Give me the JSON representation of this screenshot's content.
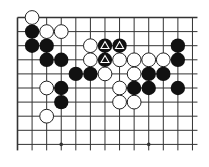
{
  "diagram": {
    "type": "go-board-fragment",
    "columns": 13,
    "rows": 10,
    "edges": {
      "top": true,
      "left": true,
      "right": false,
      "bottom": false
    },
    "star_points": [
      [
        3,
        9
      ],
      [
        9,
        9
      ]
    ],
    "colors": {
      "line": "#333333",
      "black": "#111111",
      "white": "#ffffff",
      "stone_outline": "#222222",
      "background": "#ffffff"
    },
    "stones": {
      "white": [
        [
          1,
          0
        ],
        [
          2,
          1
        ],
        [
          3,
          1
        ],
        [
          5,
          2
        ],
        [
          5,
          3
        ],
        [
          7,
          3
        ],
        [
          8,
          3
        ],
        [
          9,
          3
        ],
        [
          10,
          3
        ],
        [
          6,
          4
        ],
        [
          8,
          4
        ],
        [
          2,
          5
        ],
        [
          7,
          5
        ],
        [
          7,
          6
        ],
        [
          8,
          6
        ],
        [
          2,
          7
        ]
      ],
      "black": [
        [
          1,
          1
        ],
        [
          1,
          2
        ],
        [
          2,
          2
        ],
        [
          2,
          3
        ],
        [
          3,
          3
        ],
        [
          4,
          4
        ],
        [
          5,
          4
        ],
        [
          3,
          5
        ],
        [
          3,
          6
        ],
        [
          11,
          2
        ],
        [
          11,
          3
        ],
        [
          9,
          4
        ],
        [
          10,
          4
        ],
        [
          8,
          5
        ],
        [
          9,
          5
        ],
        [
          11,
          5
        ]
      ],
      "black_marked_triangle": [
        [
          6,
          2
        ],
        [
          7,
          2
        ],
        [
          6,
          3
        ]
      ]
    },
    "markers": {
      "triangle": "white triangle outline on black stone"
    }
  }
}
